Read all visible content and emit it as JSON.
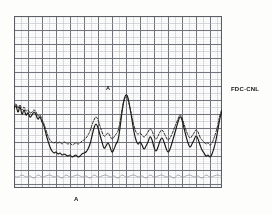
{
  "figure": {
    "kind": "strip-chart-recording",
    "background_color": "#fdfdfc",
    "paper_color": "#ffffff"
  },
  "labels": {
    "station_label": "FDC-CNL",
    "peak_marker": "A",
    "axis_marker": "A"
  },
  "grid": {
    "minor_color": "#b9bcc2",
    "major_color": "#6d7078",
    "minor_spacing_px": 7,
    "major_every": 2,
    "border_color": "#5c5f66",
    "left_px": 14,
    "top_px": 16,
    "width_px": 208,
    "height_px": 172
  },
  "chart_data": {
    "type": "line",
    "title": "",
    "subtitle": "",
    "xlabel": "",
    "ylabel": "",
    "xlim": [
      0,
      208
    ],
    "ylim": [
      0,
      172
    ],
    "grid": true,
    "legend": "none",
    "annotations": [
      {
        "text": "FDC-CNL",
        "x": 231,
        "y": 89,
        "placement": "right-of-plot"
      },
      {
        "text": "A",
        "x": 108,
        "y": 88,
        "placement": "above-main-peak"
      },
      {
        "text": "A",
        "x": 76,
        "y": 200,
        "placement": "below-time-axis"
      }
    ],
    "series": [
      {
        "name": "solid-trace",
        "style": "solid",
        "color": "#191713",
        "width": 1.15,
        "x": [
          0,
          2,
          4,
          6,
          8,
          10,
          12,
          14,
          16,
          18,
          20,
          22,
          24,
          26,
          28,
          30,
          32,
          34,
          36,
          38,
          40,
          42,
          44,
          46,
          48,
          50,
          52,
          54,
          56,
          58,
          60,
          62,
          64,
          66,
          68,
          70,
          72,
          74,
          76,
          78,
          80,
          82,
          84,
          86,
          88,
          90,
          92,
          94,
          96,
          98,
          100,
          102,
          104,
          106,
          108,
          110,
          112,
          114,
          116,
          118,
          120,
          122,
          124,
          126,
          128,
          130,
          132,
          134,
          136,
          138,
          140,
          142,
          144,
          146,
          148,
          150,
          152,
          154,
          156,
          158,
          160,
          162,
          164,
          166,
          168,
          170,
          172,
          174,
          176,
          178,
          180,
          182,
          184,
          186,
          188,
          190,
          192,
          194,
          196,
          198,
          200,
          202,
          204,
          206,
          208
        ],
        "y": [
          93,
          90,
          96,
          91,
          98,
          94,
          99,
          97,
          101,
          99,
          96,
          99,
          103,
          101,
          106,
          110,
          118,
          125,
          131,
          135,
          137,
          136,
          138,
          137,
          139,
          138,
          139,
          140,
          139,
          141,
          140,
          139,
          141,
          140,
          138,
          137,
          136,
          133,
          128,
          120,
          112,
          108,
          112,
          119,
          126,
          132,
          130,
          127,
          131,
          136,
          133,
          128,
          124,
          112,
          96,
          84,
          79,
          82,
          92,
          104,
          116,
          124,
          128,
          126,
          129,
          133,
          130,
          126,
          121,
          124,
          131,
          135,
          131,
          125,
          122,
          126,
          132,
          136,
          133,
          127,
          120,
          113,
          106,
          101,
          104,
          112,
          120,
          127,
          131,
          128,
          124,
          120,
          123,
          129,
          134,
          137,
          140,
          139,
          141,
          138,
          132,
          124,
          113,
          102,
          95
        ]
      },
      {
        "name": "dashed-trace",
        "style": "dashed",
        "color": "#2a2724",
        "width": 1.0,
        "dash": "2.4,1.5",
        "x": [
          0,
          2,
          4,
          6,
          8,
          10,
          12,
          14,
          16,
          18,
          20,
          22,
          24,
          26,
          28,
          30,
          32,
          34,
          36,
          38,
          40,
          42,
          44,
          46,
          48,
          50,
          52,
          54,
          56,
          58,
          60,
          62,
          64,
          66,
          68,
          70,
          72,
          74,
          76,
          78,
          80,
          82,
          84,
          86,
          88,
          90,
          92,
          94,
          96,
          98,
          100,
          102,
          104,
          106,
          108,
          110,
          112,
          114,
          116,
          118,
          120,
          122,
          124,
          126,
          128,
          130,
          132,
          134,
          136,
          138,
          140,
          142,
          144,
          146,
          148,
          150,
          152,
          154,
          156,
          158,
          160,
          162,
          164,
          166,
          168,
          170,
          172,
          174,
          176,
          178,
          180,
          182,
          184,
          186,
          188,
          190,
          192,
          194,
          196,
          198,
          200,
          202,
          204,
          206,
          208
        ],
        "y": [
          90,
          88,
          92,
          89,
          94,
          91,
          95,
          94,
          97,
          96,
          94,
          96,
          100,
          99,
          104,
          108,
          114,
          120,
          124,
          126,
          127,
          126,
          127,
          126,
          128,
          126,
          127,
          128,
          127,
          129,
          128,
          127,
          128,
          127,
          125,
          124,
          122,
          119,
          115,
          109,
          104,
          101,
          104,
          110,
          116,
          120,
          119,
          117,
          120,
          123,
          121,
          118,
          115,
          106,
          94,
          85,
          81,
          84,
          92,
          101,
          110,
          116,
          118,
          117,
          119,
          121,
          119,
          116,
          113,
          115,
          120,
          123,
          120,
          116,
          114,
          117,
          121,
          124,
          122,
          118,
          113,
          108,
          103,
          99,
          102,
          108,
          114,
          119,
          122,
          120,
          117,
          114,
          116,
          121,
          124,
          126,
          128,
          127,
          129,
          127,
          122,
          116,
          108,
          99,
          93
        ]
      },
      {
        "name": "baseline-trace",
        "style": "solid-faint",
        "color": "#8a8d93",
        "width": 0.7,
        "x": [
          0,
          4,
          8,
          12,
          16,
          20,
          24,
          28,
          32,
          36,
          40,
          44,
          48,
          52,
          56,
          60,
          64,
          68,
          72,
          76,
          80,
          84,
          88,
          92,
          96,
          100,
          104,
          108,
          112,
          116,
          120,
          124,
          128,
          132,
          136,
          140,
          144,
          148,
          152,
          156,
          160,
          164,
          168,
          172,
          176,
          180,
          184,
          188,
          192,
          196,
          200,
          204,
          208
        ],
        "y": [
          160,
          161,
          159,
          161,
          160,
          162,
          159,
          161,
          160,
          159,
          161,
          160,
          162,
          159,
          161,
          160,
          159,
          161,
          160,
          162,
          159,
          161,
          160,
          159,
          161,
          160,
          162,
          159,
          161,
          160,
          159,
          161,
          160,
          162,
          159,
          161,
          160,
          159,
          161,
          160,
          162,
          159,
          161,
          160,
          159,
          161,
          160,
          162,
          159,
          161,
          160,
          159,
          161
        ]
      }
    ]
  }
}
